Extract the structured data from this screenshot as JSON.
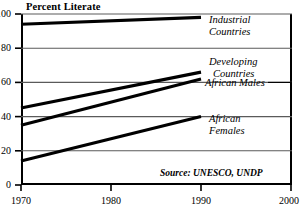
{
  "chart_data": {
    "type": "line",
    "title": "Percent Literate",
    "xlabel": "",
    "ylabel": "",
    "xlim": [
      1970,
      2000
    ],
    "ylim": [
      0,
      100
    ],
    "grid": true,
    "legend_position": "inline-right-annotations",
    "x_ticks": [
      "1970",
      "1980",
      "1990",
      "2000"
    ],
    "x_tick_values": [
      1970,
      1980,
      1990,
      2000
    ],
    "y_ticks": [
      "0",
      "20",
      "40",
      "60",
      "80",
      "100"
    ],
    "y_tick_values": [
      0,
      20,
      40,
      60,
      80,
      100
    ],
    "x": [
      1970,
      1990
    ],
    "series": [
      {
        "name": "Industrial Countries",
        "label_lines": [
          "Industrial",
          "Countries"
        ],
        "values": [
          94,
          98
        ],
        "color": "#000000"
      },
      {
        "name": "Developing Countries",
        "label_lines": [
          "Developing",
          "Countries"
        ],
        "values": [
          45,
          66
        ],
        "color": "#000000"
      },
      {
        "name": "African Males",
        "label_lines": [
          "African Males"
        ],
        "values": [
          35,
          62
        ],
        "color": "#000000"
      },
      {
        "name": "African Females",
        "label_lines": [
          "African",
          "Females"
        ],
        "values": [
          14,
          40
        ],
        "color": "#000000"
      }
    ],
    "annotations": [
      {
        "text": "Source: UNESCO, UNDP",
        "role": "source-note"
      }
    ]
  },
  "axis": {
    "y_labels": [
      "100",
      "80",
      "60",
      "40",
      "20",
      "0"
    ],
    "x_labels": [
      "1970",
      "1980",
      "1990",
      "2000"
    ]
  },
  "labels": {
    "industrial_l1": "Industrial",
    "industrial_l2": "Countries",
    "developing_l1": "Developing",
    "developing_l2": "Countries",
    "african_males": "African Males",
    "african_females_l1": "African",
    "african_females_l2": "Females",
    "source": "Source: UNESCO, UNDP"
  },
  "colors": {
    "line": "#000000",
    "grid": "#5a5a5a",
    "frame": "#000000",
    "background": "#ffffff"
  }
}
